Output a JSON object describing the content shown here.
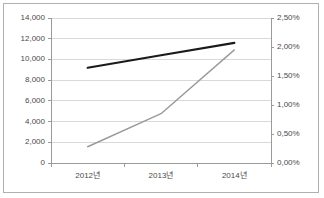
{
  "chart_data": {
    "type": "line",
    "title": "",
    "subtitle": "",
    "xlabel": "",
    "categories": [
      "2012년",
      "2013년",
      "2014년"
    ],
    "grid": true,
    "legend": "none",
    "axes": {
      "left": {
        "label": "",
        "ylim": [
          0,
          14000
        ],
        "step": 2000,
        "ticks": [
          "0",
          "2,000",
          "4,000",
          "6,000",
          "8,000",
          "10,000",
          "12,000",
          "14,000"
        ],
        "tick_values": [
          0,
          2000,
          4000,
          6000,
          8000,
          10000,
          12000,
          14000
        ]
      },
      "right": {
        "label": "",
        "ylim": [
          0,
          2.5
        ],
        "step": 0.5,
        "ticks": [
          "0,00%",
          "0,50%",
          "1,00%",
          "1,50%",
          "2,00%",
          "2,50%"
        ],
        "tick_values": [
          0,
          0.5,
          1.0,
          1.5,
          2.0,
          2.5
        ]
      }
    },
    "series": [
      {
        "name": "amount-series",
        "axis": "left",
        "color": "#1a1a1a",
        "width": 2.2,
        "values": [
          9200,
          10400,
          11600
        ]
      },
      {
        "name": "rate-series",
        "axis": "right",
        "color": "#9a9a9a",
        "width": 1.4,
        "values": [
          0.28,
          0.85,
          1.95
        ]
      }
    ],
    "colors": {
      "grid": "#d9d9d9",
      "axis": "#9a9a9a",
      "border": "#b0b0b0",
      "text": "#4a4a4a",
      "background": "#ffffff"
    }
  }
}
